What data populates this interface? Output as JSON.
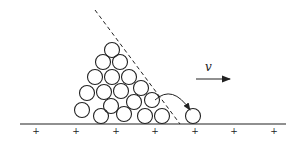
{
  "figure": {
    "colors": {
      "stroke": "#222222",
      "background": "#ffffff"
    },
    "velocity_label": "v",
    "ground": {
      "y": 124,
      "x1": 20,
      "x2": 286
    },
    "ground_markers": {
      "symbol": "+",
      "y": 131,
      "x": [
        36,
        76,
        116,
        155,
        195,
        234,
        274
      ]
    },
    "repose_line": {
      "x1": 95,
      "y1": 10,
      "x2": 180,
      "y2": 124,
      "style": "dashed"
    },
    "velocity_arrow": {
      "x1": 196,
      "y1": 79,
      "x2": 230,
      "y2": 79
    },
    "roll_arrow": {
      "from": [
        155,
        100
      ],
      "to": [
        190,
        110
      ]
    },
    "circle_radius": 7.5,
    "circles": [
      [
        112,
        50
      ],
      [
        103,
        62
      ],
      [
        120,
        62
      ],
      [
        95,
        77
      ],
      [
        112,
        77
      ],
      [
        129,
        77
      ],
      [
        87,
        93
      ],
      [
        104,
        92
      ],
      [
        121,
        91
      ],
      [
        141,
        88
      ],
      [
        111,
        106
      ],
      [
        134,
        102
      ],
      [
        152,
        100
      ],
      [
        82,
        110
      ],
      [
        101,
        116
      ],
      [
        124,
        114
      ],
      [
        145,
        116
      ],
      [
        162,
        116
      ],
      [
        193,
        116
      ]
    ]
  }
}
